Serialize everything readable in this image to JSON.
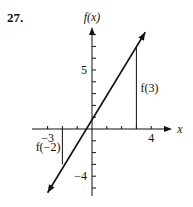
{
  "problem_number": "27.",
  "chart_data": {
    "type": "line",
    "title": "",
    "xlabel": "x",
    "ylabel": "f(x)",
    "function": "f(x) = 2x + 1",
    "xlim": [
      -4,
      5
    ],
    "ylim": [
      -5.5,
      8.5
    ],
    "x_ticks": [
      -3,
      -2,
      -1,
      1,
      2,
      3,
      4
    ],
    "y_ticks": [
      -5,
      -4,
      -3,
      -2,
      -1,
      1,
      2,
      3,
      4,
      5,
      6,
      7,
      8
    ],
    "x_tick_labels": [
      {
        "value": -3,
        "text": "−3"
      },
      {
        "value": 4,
        "text": "4"
      }
    ],
    "y_tick_labels": [
      {
        "value": 5,
        "text": "5"
      },
      {
        "value": -4,
        "text": "−4"
      }
    ],
    "series": [
      {
        "name": "f(x)",
        "x": [
          -3.0,
          3.6
        ],
        "y": [
          -5.4,
          8.2
        ]
      }
    ],
    "annotations": [
      {
        "text": "f(3)",
        "x": 3,
        "y": 7
      },
      {
        "text": "f(−2)",
        "x": -2,
        "y": -3
      }
    ],
    "grid": false,
    "color": "#111111"
  }
}
